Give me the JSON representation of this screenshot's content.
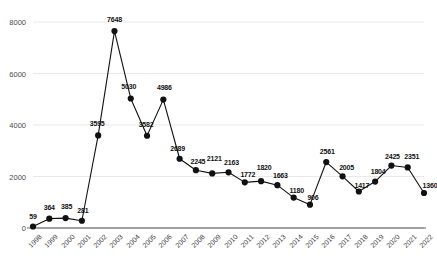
{
  "chart_data": {
    "type": "line",
    "title": "",
    "subtitle": "",
    "xlabel": "",
    "ylabel": "",
    "grid": true,
    "legend": "none",
    "marker": "filled-circle",
    "line_color": "#111111",
    "marker_color": "#111111",
    "grid_color": "#e3e3e3",
    "axis_color": "#9a9a9a",
    "ylim": [
      0,
      8000
    ],
    "yticks": [
      0,
      2000,
      4000,
      6000,
      8000
    ],
    "ytick_labels": [
      "0",
      "2000",
      "4000",
      "6000",
      "8000"
    ],
    "categories": [
      "1998",
      "1999",
      "2000",
      "2001",
      "2002",
      "2003",
      "2004",
      "2005",
      "2006",
      "2007",
      "2008",
      "2009",
      "2010",
      "2011",
      "2012",
      "2013",
      "2014",
      "2015",
      "2016",
      "2017",
      "2018",
      "2019",
      "2020",
      "2021",
      "2022"
    ],
    "values": [
      59,
      364,
      385,
      281,
      3595,
      7648,
      5030,
      3582,
      4986,
      2689,
      2245,
      2121,
      2163,
      1772,
      1820,
      1663,
      1180,
      906,
      2561,
      2005,
      1417,
      1804,
      2425,
      2351,
      1360
    ],
    "data_labels": [
      "59",
      "364",
      "385",
      "281",
      "3595",
      "7648",
      "5030",
      "3582",
      "4986",
      "2689",
      "2245",
      "2121",
      "2163",
      "1772",
      "1820",
      "1663",
      "1180",
      "906",
      "2561",
      "2005",
      "1417",
      "1804",
      "2425",
      "2351",
      "1360"
    ]
  }
}
